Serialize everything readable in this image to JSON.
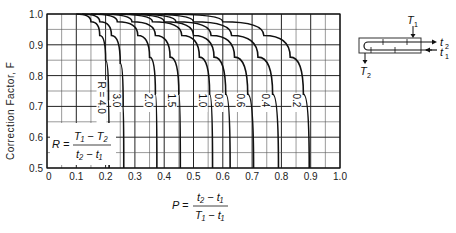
{
  "chart_data": {
    "type": "line",
    "title": "",
    "xlabel": "P = (t2 - t1) / (T1 - t1)",
    "ylabel": "Correction Factor, F",
    "xlim": [
      0,
      1.0
    ],
    "ylim": [
      0.5,
      1.0
    ],
    "x_ticks": [
      "0",
      "0.1",
      "0.2",
      "0.3",
      "0.4",
      "0.5",
      "0.6",
      "0.7",
      "0.8",
      "0.9",
      "1.0"
    ],
    "y_ticks": [
      "0.5",
      "0.6",
      "0.7",
      "0.8",
      "0.9",
      "1.0"
    ],
    "grid": true,
    "grid_minor_step": 0.05,
    "series": [
      {
        "name": "R = 4.0",
        "label": "R = 4.0",
        "points": [
          [
            0.1,
            1.0
          ],
          [
            0.15,
            0.975
          ],
          [
            0.18,
            0.93
          ],
          [
            0.2,
            0.85
          ],
          [
            0.21,
            0.72
          ],
          [
            0.212,
            0.5
          ]
        ]
      },
      {
        "name": "R = 3.0",
        "label": "3.0",
        "points": [
          [
            0.12,
            1.0
          ],
          [
            0.18,
            0.975
          ],
          [
            0.22,
            0.93
          ],
          [
            0.25,
            0.84
          ],
          [
            0.26,
            0.7
          ],
          [
            0.262,
            0.5
          ]
        ]
      },
      {
        "name": "R = 2.0",
        "label": "2.0",
        "points": [
          [
            0.15,
            1.0
          ],
          [
            0.24,
            0.975
          ],
          [
            0.31,
            0.93
          ],
          [
            0.35,
            0.86
          ],
          [
            0.37,
            0.74
          ],
          [
            0.375,
            0.5
          ]
        ]
      },
      {
        "name": "R = 1.5",
        "label": "1.5",
        "points": [
          [
            0.18,
            1.0
          ],
          [
            0.29,
            0.975
          ],
          [
            0.37,
            0.93
          ],
          [
            0.42,
            0.86
          ],
          [
            0.45,
            0.74
          ],
          [
            0.455,
            0.5
          ]
        ]
      },
      {
        "name": "R = 1.0",
        "label": "1.0",
        "points": [
          [
            0.22,
            1.0
          ],
          [
            0.36,
            0.975
          ],
          [
            0.46,
            0.93
          ],
          [
            0.52,
            0.86
          ],
          [
            0.555,
            0.74
          ],
          [
            0.565,
            0.5
          ]
        ]
      },
      {
        "name": "R = 0.8",
        "label": "0.8",
        "points": [
          [
            0.25,
            1.0
          ],
          [
            0.4,
            0.975
          ],
          [
            0.5,
            0.93
          ],
          [
            0.57,
            0.86
          ],
          [
            0.61,
            0.74
          ],
          [
            0.625,
            0.5
          ]
        ]
      },
      {
        "name": "R = 0.6",
        "label": "0.6",
        "points": [
          [
            0.28,
            1.0
          ],
          [
            0.44,
            0.975
          ],
          [
            0.56,
            0.93
          ],
          [
            0.64,
            0.86
          ],
          [
            0.685,
            0.74
          ],
          [
            0.705,
            0.5
          ]
        ]
      },
      {
        "name": "R = 0.4",
        "label": "0.4",
        "points": [
          [
            0.32,
            1.0
          ],
          [
            0.5,
            0.975
          ],
          [
            0.63,
            0.93
          ],
          [
            0.72,
            0.86
          ],
          [
            0.77,
            0.74
          ],
          [
            0.79,
            0.5
          ]
        ]
      },
      {
        "name": "R = 0.2",
        "label": "0.2",
        "points": [
          [
            0.4,
            1.0
          ],
          [
            0.6,
            0.975
          ],
          [
            0.74,
            0.93
          ],
          [
            0.83,
            0.86
          ],
          [
            0.875,
            0.74
          ],
          [
            0.895,
            0.5
          ]
        ]
      }
    ],
    "annotations": [
      "R = (T1 - T2) / (t2 - t1)"
    ]
  },
  "labels": {
    "ylabel": "Correction Factor, F",
    "R_def": {
      "lhs": "R =",
      "num": "T₁ − T₂",
      "den": "t₂ − t₁"
    },
    "P_def": {
      "lhs": "P =",
      "num": "t₂ − t₁",
      "den": "T₁ − t₁"
    },
    "diagram": {
      "T1": "T",
      "T1_sub": "1",
      "T2": "T",
      "T2_sub": "2",
      "t1": "t",
      "t1_sub": "1",
      "t2": "t",
      "t2_sub": "2"
    }
  },
  "colors": {
    "curve": "#111111",
    "grid_major": "#222222",
    "grid_minor": "#555555"
  }
}
